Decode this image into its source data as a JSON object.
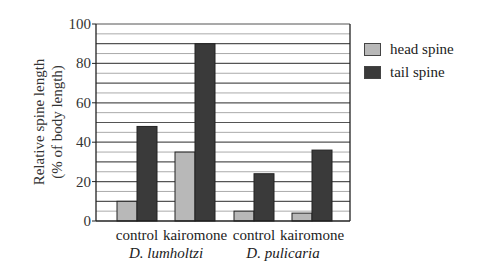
{
  "chart_data": {
    "type": "bar",
    "title": "",
    "xlabel": "",
    "ylabel": "Relative spine length (% of body length)",
    "ylabel_lines": [
      "Relative spine length",
      "(% of body length)"
    ],
    "ylim": [
      0,
      100
    ],
    "yticks": [
      0,
      20,
      40,
      60,
      80,
      100
    ],
    "minor_gridline_step": 5,
    "grid": true,
    "legend_position": "right",
    "groups": [
      {
        "label": "D. lumholtzi",
        "categories": [
          "control",
          "kairomone"
        ]
      },
      {
        "label": "D. pulicaria",
        "categories": [
          "control",
          "kairomone"
        ]
      }
    ],
    "categories": [
      "D. lumholtzi control",
      "D. lumholtzi kairomone",
      "D. pulicaria control",
      "D. pulicaria kairomone"
    ],
    "category_labels": [
      "control",
      "kairomone",
      "control",
      "kairomone"
    ],
    "series": [
      {
        "name": "head spine",
        "color": "#b8b8b8",
        "values": [
          10,
          35,
          5,
          4
        ]
      },
      {
        "name": "tail spine",
        "color": "#3a3a3a",
        "values": [
          48,
          90,
          24,
          36
        ]
      }
    ]
  },
  "legend": {
    "items": [
      {
        "label": "head spine",
        "color": "#b8b8b8"
      },
      {
        "label": "tail spine",
        "color": "#3a3a3a"
      }
    ]
  }
}
